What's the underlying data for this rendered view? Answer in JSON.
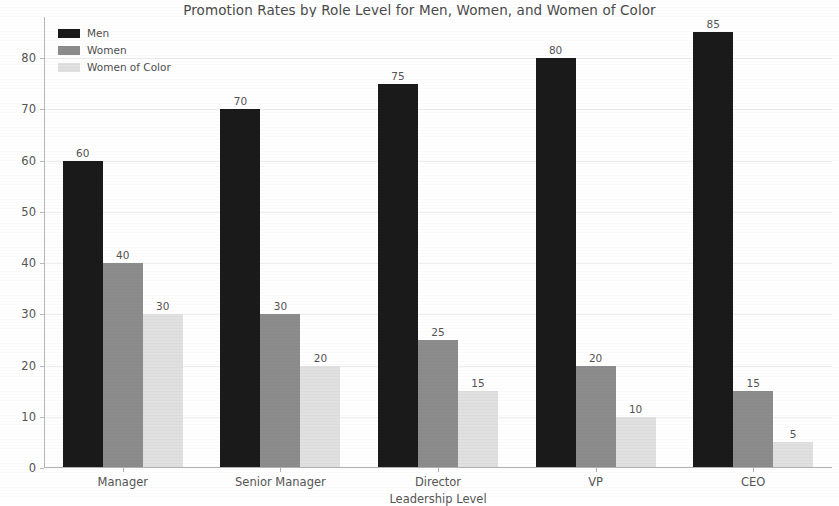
{
  "chart_data": {
    "type": "bar",
    "title": "Promotion Rates by Role Level for Men, Women, and Women of Color",
    "xlabel": "Leadership Level",
    "ylabel": "Promotion Rate (%)",
    "categories": [
      "Manager",
      "Senior Manager",
      "Director",
      "VP",
      "CEO"
    ],
    "series": [
      {
        "name": "Men",
        "color": "#1a1a1a",
        "values": [
          60,
          70,
          75,
          80,
          85
        ]
      },
      {
        "name": "Women",
        "color": "#8c8c8c",
        "values": [
          40,
          30,
          25,
          20,
          15
        ]
      },
      {
        "name": "Women of Color",
        "color": "#e0e0e0",
        "values": [
          30,
          20,
          15,
          10,
          5
        ]
      }
    ],
    "ylim": [
      0,
      88
    ],
    "yticks": [
      0,
      10,
      20,
      30,
      40,
      50,
      60,
      70,
      80
    ],
    "ytick_labels": [
      "0",
      "10",
      "20",
      "30",
      "40",
      "50",
      "60",
      "70",
      "80"
    ],
    "grid": true,
    "grid_axis": "y",
    "legend_position": "upper left",
    "bar_labels_shown": true,
    "background_color": "#ffffff",
    "axis_color": "#b0b0b0",
    "text_color": "#555555"
  }
}
